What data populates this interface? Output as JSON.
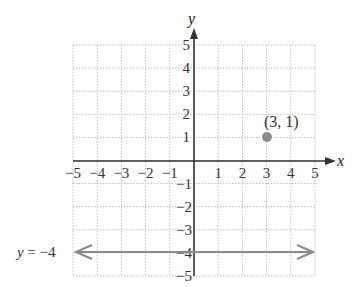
{
  "chart_data": {
    "type": "scatter",
    "title": "",
    "xlabel": "x",
    "ylabel": "y",
    "xlim": [
      -5,
      5
    ],
    "ylim": [
      -5,
      5
    ],
    "grid": true,
    "x_ticks": [
      "−5",
      "−4",
      "−3",
      "−2",
      "−1",
      "1",
      "2",
      "3",
      "4",
      "5"
    ],
    "y_ticks_positive": [
      "5",
      "4",
      "3",
      "2",
      "1"
    ],
    "y_ticks_negative": [
      "−1",
      "−2",
      "−3",
      "−4",
      "−5"
    ],
    "points": [
      {
        "x": 3,
        "y": 1,
        "label": "(3, 1)",
        "color": "#888888"
      }
    ],
    "lines": [
      {
        "equation": "y = −4",
        "type": "horizontal",
        "y": -4,
        "color": "#888888",
        "arrows": "both"
      }
    ]
  },
  "labels": {
    "x_axis": "x",
    "y_axis": "y",
    "point_label": "(3, 1)",
    "line_label": "y = −4"
  }
}
